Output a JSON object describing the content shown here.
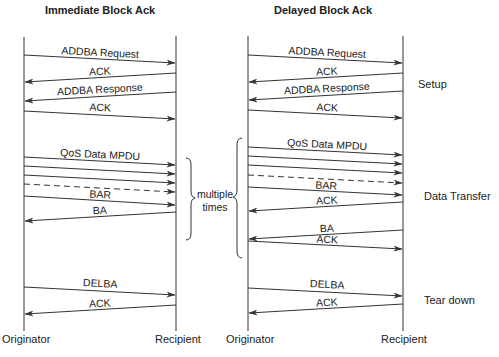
{
  "diagrams": [
    {
      "title": "Immediate Block Ack",
      "originator_label": "Originator",
      "recipient_label": "Recipient",
      "messages": [
        {
          "label": "ADDBA Request",
          "direction": "to-recipient",
          "style": "solid"
        },
        {
          "label": "ACK",
          "direction": "to-originator",
          "style": "solid"
        },
        {
          "label": "ADDBA Response",
          "direction": "to-originator",
          "style": "solid"
        },
        {
          "label": "ACK",
          "direction": "to-recipient",
          "style": "solid"
        },
        {
          "label": "QoS Data MPDU",
          "direction": "to-recipient",
          "style": "solid"
        },
        {
          "label": "",
          "direction": "to-recipient",
          "style": "solid"
        },
        {
          "label": "",
          "direction": "to-recipient",
          "style": "solid"
        },
        {
          "label": "",
          "direction": "to-recipient",
          "style": "dashed"
        },
        {
          "label": "BAR",
          "direction": "to-recipient",
          "style": "solid"
        },
        {
          "label": "BA",
          "direction": "to-originator",
          "style": "solid"
        },
        {
          "label": "DELBA",
          "direction": "to-recipient",
          "style": "solid"
        },
        {
          "label": "ACK",
          "direction": "to-originator",
          "style": "solid"
        }
      ]
    },
    {
      "title": "Delayed Block Ack",
      "originator_label": "Originator",
      "recipient_label": "Recipient",
      "messages": [
        {
          "label": "ADDBA Request",
          "direction": "to-recipient",
          "style": "solid"
        },
        {
          "label": "ACK",
          "direction": "to-originator",
          "style": "solid"
        },
        {
          "label": "ADDBA Response",
          "direction": "to-originator",
          "style": "solid"
        },
        {
          "label": "ACK",
          "direction": "to-recipient",
          "style": "solid"
        },
        {
          "label": "QoS Data MPDU",
          "direction": "to-recipient",
          "style": "solid"
        },
        {
          "label": "",
          "direction": "to-recipient",
          "style": "solid"
        },
        {
          "label": "",
          "direction": "to-recipient",
          "style": "solid"
        },
        {
          "label": "",
          "direction": "to-recipient",
          "style": "dashed"
        },
        {
          "label": "BAR",
          "direction": "to-recipient",
          "style": "solid"
        },
        {
          "label": "ACK",
          "direction": "to-originator",
          "style": "solid"
        },
        {
          "label": "BA",
          "direction": "to-originator",
          "style": "solid"
        },
        {
          "label": "ACK",
          "direction": "to-recipient",
          "style": "solid"
        },
        {
          "label": "DELBA",
          "direction": "to-recipient",
          "style": "solid"
        },
        {
          "label": "ACK",
          "direction": "to-originator",
          "style": "solid"
        }
      ]
    }
  ],
  "repeat_annotation": {
    "line1": "multiple",
    "line2": "times"
  },
  "phases": {
    "setup": "Setup",
    "data_transfer": "Data Transfer",
    "tear_down": "Tear down"
  }
}
